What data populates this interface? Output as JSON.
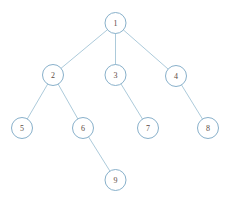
{
  "diagram": {
    "type": "tree",
    "canvas": {
      "width": 235,
      "height": 200,
      "background": "#ffffff"
    },
    "style": {
      "edge_color": "#a3c4d6",
      "edge_width": 0.9,
      "node_stroke": "#7ba7c4",
      "node_stroke_width": 0.9,
      "node_fill": "#ffffff",
      "node_radius": 10.5,
      "label_color": "#5c4b43",
      "label_font_size": 8
    },
    "root": "1",
    "levels": [
      [
        "1"
      ],
      [
        "2",
        "3",
        "4"
      ],
      [
        "5",
        "6",
        "7",
        "8"
      ],
      [
        "9"
      ]
    ],
    "nodes": [
      {
        "id": "1",
        "label": "1",
        "x": 115.5,
        "y": 23,
        "level": 0,
        "parent": null
      },
      {
        "id": "2",
        "label": "2",
        "x": 53,
        "y": 75,
        "level": 1,
        "parent": "1"
      },
      {
        "id": "3",
        "label": "3",
        "x": 115.5,
        "y": 75,
        "level": 1,
        "parent": "1"
      },
      {
        "id": "4",
        "label": "4",
        "x": 176,
        "y": 76,
        "level": 1,
        "parent": "1"
      },
      {
        "id": "5",
        "label": "5",
        "x": 22,
        "y": 128,
        "level": 2,
        "parent": "2"
      },
      {
        "id": "6",
        "label": "6",
        "x": 83,
        "y": 128,
        "level": 2,
        "parent": "2"
      },
      {
        "id": "7",
        "label": "7",
        "x": 148,
        "y": 128,
        "level": 2,
        "parent": "3"
      },
      {
        "id": "8",
        "label": "8",
        "x": 208,
        "y": 128,
        "level": 2,
        "parent": "4"
      },
      {
        "id": "9",
        "label": "9",
        "x": 115.5,
        "y": 180,
        "level": 3,
        "parent": "6"
      }
    ],
    "edges": [
      {
        "from": "1",
        "to": "2"
      },
      {
        "from": "1",
        "to": "3"
      },
      {
        "from": "1",
        "to": "4"
      },
      {
        "from": "2",
        "to": "5"
      },
      {
        "from": "2",
        "to": "6"
      },
      {
        "from": "3",
        "to": "7"
      },
      {
        "from": "4",
        "to": "8"
      },
      {
        "from": "6",
        "to": "9"
      }
    ]
  }
}
